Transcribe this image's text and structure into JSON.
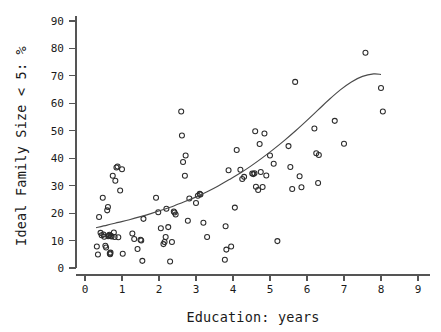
{
  "chart_data": {
    "type": "scatter",
    "title": "",
    "xlabel": "Education: years",
    "ylabel": "Ideal Family Size < 5: %",
    "xlim": [
      0,
      9
    ],
    "ylim": [
      0,
      90
    ],
    "xticks": [
      0,
      1,
      2,
      3,
      4,
      5,
      6,
      7,
      8,
      9
    ],
    "yticks": [
      0,
      10,
      20,
      30,
      40,
      50,
      60,
      70,
      80,
      90
    ],
    "grid": false,
    "legend": null,
    "marker": "open-circle",
    "marker_color": "#2b2b2b",
    "curve_color": "#4a4a4a",
    "series": [
      {
        "name": "countries",
        "points": [
          [
            0.32,
            7.8
          ],
          [
            0.35,
            4.9
          ],
          [
            0.38,
            18.6
          ],
          [
            0.42,
            12.8
          ],
          [
            0.45,
            11.9
          ],
          [
            0.48,
            25.6
          ],
          [
            0.5,
            12.2
          ],
          [
            0.52,
            11.4
          ],
          [
            0.55,
            8.1
          ],
          [
            0.57,
            7.5
          ],
          [
            0.6,
            21.0
          ],
          [
            0.62,
            22.2
          ],
          [
            0.63,
            11.6
          ],
          [
            0.65,
            11.8
          ],
          [
            0.66,
            12.1
          ],
          [
            0.67,
            5.3
          ],
          [
            0.68,
            5.0
          ],
          [
            0.69,
            5.6
          ],
          [
            0.7,
            11.7
          ],
          [
            0.72,
            11.5
          ],
          [
            0.75,
            33.6
          ],
          [
            0.78,
            12.9
          ],
          [
            0.8,
            11.3
          ],
          [
            0.82,
            31.8
          ],
          [
            0.85,
            36.6
          ],
          [
            0.88,
            37.0
          ],
          [
            0.9,
            11.2
          ],
          [
            0.95,
            28.2
          ],
          [
            1.0,
            36.0
          ],
          [
            1.02,
            5.2
          ],
          [
            1.28,
            12.6
          ],
          [
            1.33,
            10.6
          ],
          [
            1.42,
            6.9
          ],
          [
            1.5,
            10.3
          ],
          [
            1.52,
            10.0
          ],
          [
            1.55,
            2.6
          ],
          [
            1.58,
            17.9
          ],
          [
            1.92,
            25.6
          ],
          [
            1.98,
            20.3
          ],
          [
            2.05,
            14.5
          ],
          [
            2.12,
            8.7
          ],
          [
            2.15,
            9.5
          ],
          [
            2.18,
            11.3
          ],
          [
            2.2,
            21.6
          ],
          [
            2.25,
            14.9
          ],
          [
            2.3,
            2.4
          ],
          [
            2.35,
            9.5
          ],
          [
            2.4,
            20.6
          ],
          [
            2.42,
            20.2
          ],
          [
            2.45,
            19.5
          ],
          [
            2.6,
            57.0
          ],
          [
            2.62,
            48.3
          ],
          [
            2.65,
            38.6
          ],
          [
            2.7,
            33.6
          ],
          [
            2.72,
            41.0
          ],
          [
            2.78,
            17.2
          ],
          [
            2.82,
            25.3
          ],
          [
            3.0,
            23.7
          ],
          [
            3.05,
            26.3
          ],
          [
            3.1,
            27.0
          ],
          [
            3.12,
            26.8
          ],
          [
            3.2,
            16.5
          ],
          [
            3.3,
            11.3
          ],
          [
            3.78,
            3.0
          ],
          [
            3.8,
            15.2
          ],
          [
            3.82,
            6.7
          ],
          [
            3.88,
            35.6
          ],
          [
            3.95,
            7.8
          ],
          [
            4.05,
            22.0
          ],
          [
            4.1,
            43.0
          ],
          [
            4.2,
            35.8
          ],
          [
            4.25,
            32.4
          ],
          [
            4.3,
            33.2
          ],
          [
            4.52,
            34.4
          ],
          [
            4.55,
            34.2
          ],
          [
            4.58,
            34.5
          ],
          [
            4.6,
            49.8
          ],
          [
            4.62,
            29.6
          ],
          [
            4.68,
            28.4
          ],
          [
            4.72,
            45.2
          ],
          [
            4.75,
            35.0
          ],
          [
            4.8,
            29.5
          ],
          [
            4.85,
            49.0
          ],
          [
            4.9,
            33.7
          ],
          [
            5.0,
            41.0
          ],
          [
            5.1,
            38.0
          ],
          [
            5.2,
            9.8
          ],
          [
            5.5,
            44.4
          ],
          [
            5.55,
            36.8
          ],
          [
            5.6,
            28.8
          ],
          [
            5.68,
            67.8
          ],
          [
            5.8,
            33.4
          ],
          [
            5.85,
            29.4
          ],
          [
            6.2,
            50.8
          ],
          [
            6.25,
            41.8
          ],
          [
            6.3,
            31.0
          ],
          [
            6.32,
            41.2
          ],
          [
            6.75,
            53.6
          ],
          [
            7.0,
            45.3
          ],
          [
            7.58,
            78.4
          ],
          [
            8.0,
            65.6
          ],
          [
            8.05,
            57.0
          ]
        ]
      }
    ],
    "fit_curve": {
      "name": "fitted exponential trend",
      "points": [
        [
          0.3,
          14.7
        ],
        [
          0.6,
          15.6
        ],
        [
          0.9,
          16.6
        ],
        [
          1.2,
          17.6
        ],
        [
          1.5,
          18.7
        ],
        [
          1.8,
          19.9
        ],
        [
          2.1,
          21.2
        ],
        [
          2.4,
          22.6
        ],
        [
          2.7,
          24.2
        ],
        [
          3.0,
          25.9
        ],
        [
          3.3,
          27.8
        ],
        [
          3.6,
          29.9
        ],
        [
          3.9,
          32.2
        ],
        [
          4.2,
          34.6
        ],
        [
          4.5,
          37.3
        ],
        [
          4.8,
          40.2
        ],
        [
          5.1,
          43.3
        ],
        [
          5.4,
          46.6
        ],
        [
          5.7,
          50.1
        ],
        [
          6.0,
          53.8
        ],
        [
          6.3,
          57.6
        ],
        [
          6.6,
          61.4
        ],
        [
          6.9,
          64.9
        ],
        [
          7.2,
          67.8
        ],
        [
          7.5,
          69.8
        ],
        [
          7.8,
          70.7
        ],
        [
          8.0,
          70.5
        ]
      ]
    }
  }
}
